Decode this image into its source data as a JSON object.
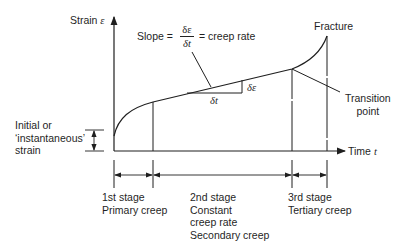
{
  "diagram": {
    "type": "creep-curve",
    "axes": {
      "y_label": "Strain",
      "y_symbol": "ε",
      "x_label": "Time",
      "x_symbol": "t"
    },
    "slope_annotation": {
      "prefix": "Slope =",
      "numerator": "δε",
      "denominator": "δt",
      "suffix": "= creep rate"
    },
    "triangle_labels": {
      "horizontal": "δt",
      "vertical": "δε"
    },
    "fracture_label": "Fracture",
    "transition_label": [
      "Transition",
      "point"
    ],
    "initial_strain_label": [
      "Initial or",
      "‘instantaneous’",
      "strain"
    ],
    "stages": [
      {
        "lines": [
          "1st stage",
          "Primary creep"
        ]
      },
      {
        "lines": [
          "2nd stage",
          "Constant",
          "creep rate",
          "Secondary creep"
        ]
      },
      {
        "lines": [
          "3rd stage",
          "Tertiary creep"
        ]
      }
    ],
    "colors": {
      "ink": "#1f1f1f",
      "background": "#ffffff"
    }
  }
}
